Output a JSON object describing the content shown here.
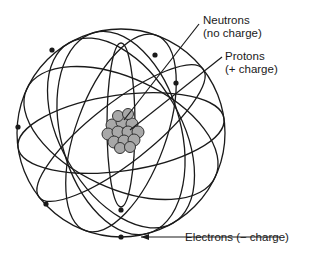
{
  "diagram": {
    "labels": {
      "neutrons": {
        "line1": "Neutrons",
        "line2": "(no charge)"
      },
      "protons": {
        "line1": "Protons",
        "line2": "(+ charge)"
      },
      "electrons": {
        "line1": "Electrons (− charge)"
      }
    },
    "colors": {
      "line": "#1a1a1a",
      "nucleon_fill": "#a8a8a8",
      "nucleon_stroke": "#333333",
      "background": "#ffffff"
    }
  }
}
